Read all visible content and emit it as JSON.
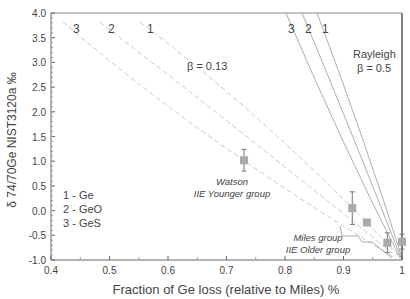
{
  "chart_data": {
    "type": "scatter",
    "title": "",
    "xlabel": "Fraction of Ge loss (relative to Miles) %",
    "ylabel": "δ 74/70Ge NIST3120a ‰",
    "xlim": [
      0.4,
      1.0
    ],
    "ylim": [
      -1.0,
      4.0
    ],
    "x_ticks": [
      "0.4",
      "0.5",
      "0.6",
      "0.7",
      "0.8",
      "0.9",
      "1"
    ],
    "y_ticks": [
      "4.0",
      "3.5",
      "3.0",
      "2.5",
      "2.0",
      "1.5",
      "1.0",
      "0.5",
      "0.0",
      "-0.5",
      "-1.0"
    ],
    "grid": false,
    "points": [
      {
        "x": 0.73,
        "y": 1.02,
        "err": 0.22,
        "group": "Watson"
      },
      {
        "x": 0.915,
        "y": 0.05,
        "err": 0.33,
        "group": "Miles"
      },
      {
        "x": 0.94,
        "y": -0.24,
        "err": 0,
        "group": "Miles"
      },
      {
        "x": 0.975,
        "y": -0.65,
        "err": 0.2,
        "group": "Miles"
      },
      {
        "x": 1.0,
        "y": -0.63,
        "err": 0.15,
        "group": "Miles"
      }
    ],
    "curves": {
      "rayleigh_beta_0_5": [
        {
          "label": "3",
          "x_top": 0.813
        },
        {
          "label": "2",
          "x_top": 0.843
        },
        {
          "label": "1",
          "x_top": 0.868
        }
      ],
      "beta_0_13": [
        {
          "label": "3",
          "x_top": 0.42
        },
        {
          "label": "2",
          "x_top": 0.49
        },
        {
          "label": "1",
          "x_top": 0.56
        }
      ]
    },
    "annotations": {
      "beta_013": "β = 0.13",
      "rayleigh": "Rayleigh",
      "rayleigh_beta": "β = 0.5",
      "watson_name": "Watson",
      "watson_group": "IIE Younger group",
      "miles_name": "Miles group",
      "miles_group": "IIE Older group",
      "curve_labels_left": [
        "3",
        "2",
        "1"
      ],
      "curve_labels_right": [
        "3",
        "2",
        "1"
      ]
    },
    "legend": [
      "1 - Ge",
      "2 - GeO",
      "3 - GeS"
    ]
  }
}
